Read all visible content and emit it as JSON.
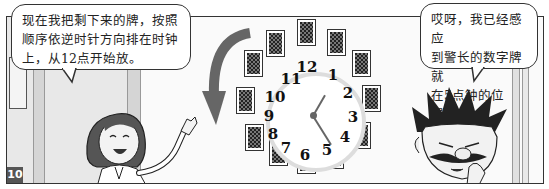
{
  "panel": {
    "number": "10"
  },
  "bubbles": {
    "left": {
      "speaker": "woman",
      "lines": [
        "现在我把剩下来的牌，按照",
        "顺序依逆时针方向排在时钟",
        "上，从12点开始放。"
      ]
    },
    "right": {
      "speaker": "man",
      "lines": [
        "哎呀，我已经感应",
        "到警长的数字牌就",
        "在5点钟的位置。"
      ]
    }
  },
  "clock": {
    "numbers": [
      "12",
      "1",
      "2",
      "3",
      "4",
      "5",
      "6",
      "7",
      "8",
      "9",
      "10",
      "11"
    ],
    "hour_hand_points_to": "1",
    "minute_hand_points_to": "5",
    "card_count": 12,
    "arrow_direction": "counterclockwise"
  },
  "colors": {
    "border": "#333333",
    "arrow": "#666666",
    "card_back": "#222222"
  }
}
